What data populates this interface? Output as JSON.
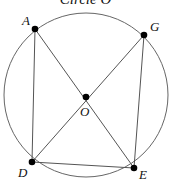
{
  "diagram": {
    "title": "Circle O",
    "circle": {
      "center": "O",
      "cx": 86,
      "cy": 95,
      "r": 82
    },
    "points": [
      {
        "name": "A",
        "x": 35,
        "y": 29
      },
      {
        "name": "G",
        "x": 144,
        "y": 35
      },
      {
        "name": "O",
        "x": 86,
        "y": 97
      },
      {
        "name": "D",
        "x": 32,
        "y": 162
      },
      {
        "name": "E",
        "x": 134,
        "y": 168
      }
    ],
    "segments": [
      [
        "A",
        "D"
      ],
      [
        "A",
        "E"
      ],
      [
        "G",
        "D"
      ],
      [
        "G",
        "E"
      ],
      [
        "D",
        "E"
      ]
    ],
    "labels": {
      "A": "A",
      "G": "G",
      "O": "O",
      "D": "D",
      "E": "E"
    },
    "stroke_color": "#555555",
    "point_color": "#000000"
  }
}
